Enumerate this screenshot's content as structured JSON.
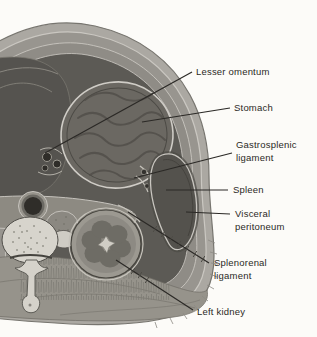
{
  "figure": {
    "labels": [
      {
        "name": "lesser-omentum",
        "lines": [
          "Lesser omentum"
        ]
      },
      {
        "name": "stomach",
        "lines": [
          "Stomach"
        ]
      },
      {
        "name": "gastrosplenic-ligament",
        "lines": [
          "Gastrosplenic",
          "ligament"
        ]
      },
      {
        "name": "spleen",
        "lines": [
          "Spleen"
        ]
      },
      {
        "name": "visceral-peritoneum",
        "lines": [
          "Visceral",
          "peritoneum"
        ]
      },
      {
        "name": "splenorenal-ligament",
        "lines": [
          "Splenorenal",
          "ligament"
        ]
      },
      {
        "name": "left-kidney",
        "lines": [
          "Left kidney"
        ]
      }
    ],
    "colors": {
      "background": "#fcfbf8",
      "fat": "#aba8a2",
      "muscle_outer": "#98958f",
      "muscle_inner": "#8f8c86",
      "cavity": "#5c5a55",
      "left_mass": "#55534f",
      "stomach": "#6b6862",
      "spleen": "#54524d",
      "kidney": "#8d8a83",
      "kidney_lobe": "#6e6c65",
      "bone": "#d7d4cc",
      "pancreas_band": "#8d8a82",
      "back_muscle": "#96938b",
      "aorta_lumen": "#2f2d29",
      "label_text": "#2b2925",
      "leader_line": "#2b2925"
    }
  }
}
